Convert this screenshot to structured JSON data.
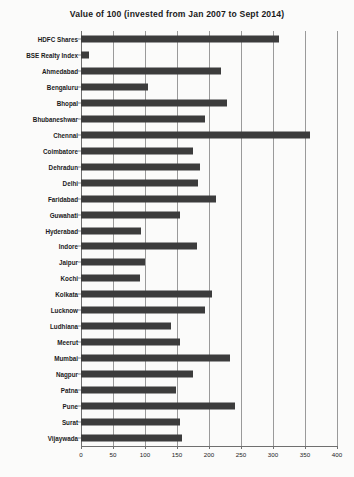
{
  "chart": {
    "title": "Value of 100 (invested from Jan 2007 to Sept 2014)"
  },
  "chart_data": {
    "type": "bar",
    "orientation": "horizontal",
    "title": "Value of 100 (invested from Jan 2007 to Sept 2014)",
    "xlabel": "",
    "ylabel": "",
    "xlim": [
      0,
      400
    ],
    "xticks": [
      0,
      50,
      100,
      150,
      200,
      250,
      300,
      350,
      400
    ],
    "tick_labels": [
      "0",
      "50",
      "100",
      "150",
      "200",
      "250",
      "300",
      "350",
      "400"
    ],
    "grid": true,
    "legend": false,
    "bar_color": "#3c3c3c",
    "background_color": "#fbfbfa",
    "categories": [
      "HDFC Shares",
      "BSE Realty Index",
      "Ahmedabad",
      "Bengaluru",
      "Bhopal",
      "Bhubaneshwar",
      "Chennai",
      "Coimbatore",
      "Dehradun",
      "Delhi",
      "Faridabad",
      "Guwahati",
      "Hyderabad",
      "Indore",
      "Jaipur",
      "Kochi",
      "Kolkata",
      "Lucknow",
      "Ludhiana",
      "Meerut",
      "Mumbai",
      "Nagpur",
      "Patna",
      "Pune",
      "Surat",
      "Vijaywada"
    ],
    "values": [
      310,
      13,
      218,
      105,
      228,
      194,
      358,
      175,
      186,
      183,
      211,
      155,
      94,
      182,
      100,
      92,
      205,
      194,
      141,
      155,
      233,
      175,
      148,
      241,
      155,
      158
    ]
  }
}
